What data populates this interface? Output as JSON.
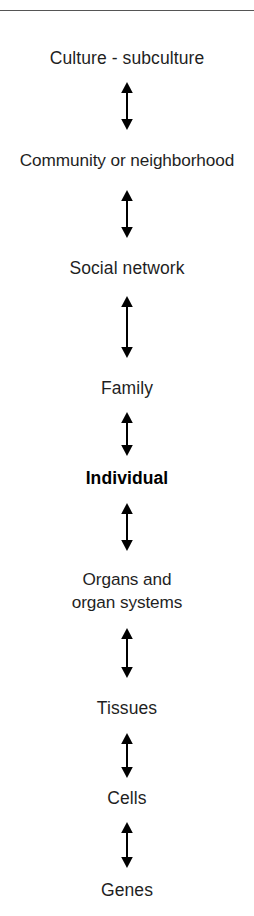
{
  "figure": {
    "type": "vertical-hierarchy-diagram",
    "title": "",
    "top_rule": true,
    "arrow_style": "double-headed-vertical",
    "arrow_color": "#000000",
    "background_color": "#ffffff",
    "text_color": "#1f1f1f",
    "emphasis_color": "#000000"
  },
  "levels": [
    {
      "id": "culture-subculture",
      "label": "Culture - subculture",
      "bold": false,
      "top": 47,
      "lines": 1
    },
    {
      "id": "community-or-neighborhood",
      "label": "Community or neighborhood",
      "bold": false,
      "top": 149,
      "lines": 1
    },
    {
      "id": "social-network",
      "label": "Social network",
      "bold": false,
      "top": 257,
      "lines": 1
    },
    {
      "id": "family",
      "label": "Family",
      "bold": false,
      "top": 377,
      "lines": 1
    },
    {
      "id": "individual",
      "label": "Individual",
      "bold": true,
      "top": 467,
      "lines": 1
    },
    {
      "id": "organs-and-organ-systems",
      "label": "Organs and\norgan systems",
      "bold": false,
      "top": 568,
      "lines": 2
    },
    {
      "id": "tissues",
      "label": "Tissues",
      "bold": false,
      "top": 697,
      "lines": 1
    },
    {
      "id": "cells",
      "label": "Cells",
      "bold": false,
      "top": 787,
      "lines": 1
    },
    {
      "id": "genes",
      "label": "Genes",
      "bold": false,
      "top": 879,
      "lines": 1
    }
  ],
  "connectors": [
    {
      "id": "arrow-culture-community",
      "from": "culture-subculture",
      "to": "community-or-neighborhood",
      "top": 82,
      "height": 48
    },
    {
      "id": "arrow-community-social",
      "from": "community-or-neighborhood",
      "to": "social-network",
      "top": 190,
      "height": 48
    },
    {
      "id": "arrow-social-family",
      "from": "social-network",
      "to": "family",
      "top": 296,
      "height": 62
    },
    {
      "id": "arrow-family-individual",
      "from": "family",
      "to": "individual",
      "top": 412,
      "height": 44
    },
    {
      "id": "arrow-individual-organs",
      "from": "individual",
      "to": "organs-and-organ-systems",
      "top": 503,
      "height": 48
    },
    {
      "id": "arrow-organs-tissues",
      "from": "organs-and-organ-systems",
      "to": "tissues",
      "top": 628,
      "height": 50
    },
    {
      "id": "arrow-tissues-cells",
      "from": "tissues",
      "to": "cells",
      "top": 733,
      "height": 45
    },
    {
      "id": "arrow-cells-genes",
      "from": "cells",
      "to": "genes",
      "top": 822,
      "height": 46
    }
  ]
}
